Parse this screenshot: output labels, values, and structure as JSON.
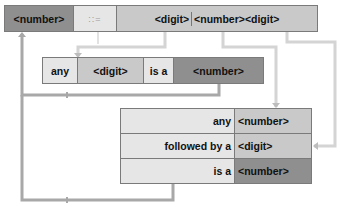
{
  "grammar_rule": {
    "lhs": "<number>",
    "operator": "::=",
    "rhs_alt1": "<digit>",
    "rhs_alt2": "<number><digit>"
  },
  "rule_1": {
    "word_any": "any",
    "term_digit": "<digit>",
    "word_is_a": "is a",
    "term_number": "<number>"
  },
  "rule_2": {
    "rows": [
      {
        "label": "any",
        "term": "<number>"
      },
      {
        "label": "followed by a",
        "term": "<digit>"
      },
      {
        "label": "is a",
        "term": "<number>"
      }
    ]
  },
  "colors": {
    "dark": "#8f8f8f",
    "mid": "#c9c9c9",
    "light": "#e6e6e6",
    "connector_dark": "#a8a8a8",
    "connector_light": "#d6d6d6"
  }
}
